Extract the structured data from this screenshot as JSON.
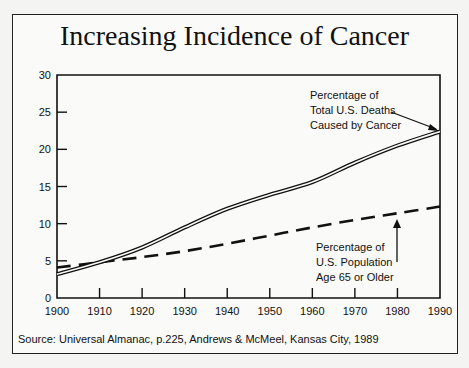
{
  "chart_data": {
    "type": "line",
    "title": "Increasing Incidence of Cancer",
    "xlabel": "",
    "ylabel": "",
    "x": [
      1900,
      1910,
      1920,
      1930,
      1940,
      1950,
      1960,
      1970,
      1980,
      1990
    ],
    "xlim": [
      1900,
      1990
    ],
    "ylim": [
      0,
      30
    ],
    "yticks": [
      0,
      5,
      10,
      15,
      20,
      25,
      30
    ],
    "xticks": [
      1900,
      1910,
      1920,
      1930,
      1940,
      1950,
      1960,
      1970,
      1980,
      1990
    ],
    "grid": false,
    "series": [
      {
        "name": "Percentage of Total U.S. Deaths Caused by Cancer",
        "style": "double-line",
        "values": [
          3.2,
          4.8,
          6.8,
          9.5,
          12.0,
          13.9,
          15.6,
          18.2,
          20.5,
          22.4
        ]
      },
      {
        "name": "Percentage of U.S. Population Age 65 or Older",
        "style": "dashed",
        "values": [
          4.1,
          4.8,
          5.5,
          6.3,
          7.3,
          8.4,
          9.5,
          10.5,
          11.4,
          12.3
        ]
      }
    ],
    "annotations": [
      {
        "text": "Percentage of Total U.S. Deaths Caused by Cancer",
        "points_to": "series 0 at 1990"
      },
      {
        "text": "Percentage of U.S. Population Age 65 or Older",
        "points_to": "series 1 at ~1980"
      }
    ],
    "source": "Source:  Universal Almanac, p.225, Andrews & McMeel, Kansas City, 1989"
  },
  "title": "Increasing Incidence of Cancer",
  "annotation_cancer": [
    "Percentage of",
    "Total U.S. Deaths",
    "Caused by Cancer"
  ],
  "annotation_age": [
    "Percentage of",
    "U.S. Population",
    "Age 65 or Older"
  ],
  "source": "Source:  Universal Almanac, p.225, Andrews & McMeel, Kansas City, 1989"
}
